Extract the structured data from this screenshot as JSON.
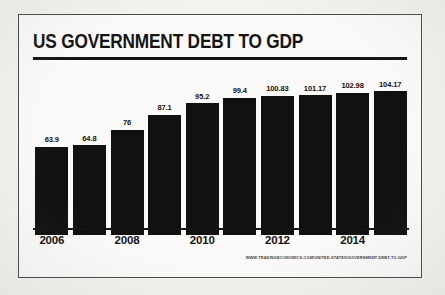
{
  "poster": {
    "title": "US GOVERNMENT DEBT TO GDP",
    "source": "WWW.TRADINGECONOMICS.COM/UNITED-STATES/GOVERNMENT-DEBT-TO-GDP",
    "bar_color": "#111110",
    "frame_color": "#4a4a48",
    "background_color": "#f3f2ef",
    "panel_color": "#fbfaf8",
    "text_color": "#141414"
  },
  "chart_data": {
    "type": "bar",
    "title": "US GOVERNMENT DEBT TO GDP",
    "xlabel": "",
    "ylabel": "",
    "ylim": [
      0,
      110
    ],
    "grid": false,
    "legend": false,
    "categories": [
      "2006",
      "2007",
      "2008",
      "2009",
      "2010",
      "2011",
      "2012",
      "2013",
      "2014",
      "2015"
    ],
    "tick_labels": [
      "2006",
      "",
      "2008",
      "",
      "2010",
      "",
      "2012",
      "",
      "2014",
      ""
    ],
    "values": [
      63.9,
      64.8,
      76,
      87.1,
      95.2,
      99.4,
      100.83,
      101.17,
      102.98,
      104.17
    ],
    "value_labels": [
      "63.9",
      "64.8",
      "76",
      "87.1",
      "95.2",
      "99.4",
      "100.83",
      "101.17",
      "102.98",
      "104.17"
    ]
  }
}
